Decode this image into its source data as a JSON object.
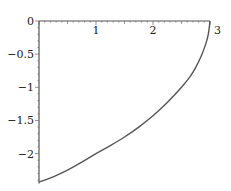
{
  "chart_data": {
    "type": "line",
    "title": "",
    "xlabel": "",
    "ylabel": "",
    "xlim": [
      0,
      3
    ],
    "ylim": [
      -2.45,
      0
    ],
    "grid": false,
    "legend": null,
    "x_ticks": [
      {
        "value": 0,
        "label": "0"
      },
      {
        "value": 1,
        "label": "1"
      },
      {
        "value": 2,
        "label": "2"
      },
      {
        "value": 3,
        "label": "3"
      }
    ],
    "y_ticks": [
      {
        "value": 0,
        "label": "0"
      },
      {
        "value": -0.5,
        "label": "−0.5"
      },
      {
        "value": -1,
        "label": "−1"
      },
      {
        "value": -1.5,
        "label": "−1.5"
      },
      {
        "value": -2,
        "label": "−2"
      }
    ],
    "series": [
      {
        "name": "curve",
        "color": "#555555",
        "x": [
          0,
          0.25,
          0.5,
          0.75,
          1.0,
          1.25,
          1.5,
          1.75,
          2.0,
          2.25,
          2.5,
          2.65,
          2.75,
          2.85,
          2.92,
          2.97,
          3.0
        ],
        "y": [
          -2.43,
          -2.35,
          -2.25,
          -2.13,
          -2.0,
          -1.88,
          -1.75,
          -1.6,
          -1.43,
          -1.23,
          -1.0,
          -0.84,
          -0.7,
          -0.52,
          -0.36,
          -0.2,
          0.0
        ]
      }
    ]
  }
}
